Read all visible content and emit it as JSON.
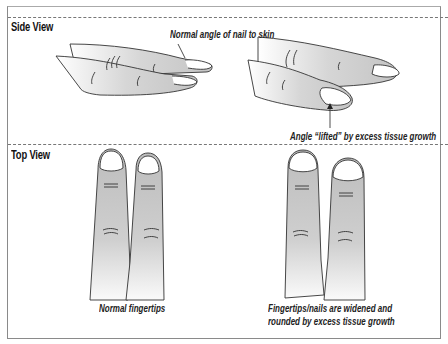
{
  "diagram": {
    "sections": [
      {
        "title": "Side View",
        "panels": [
          {
            "id": "side-normal",
            "caption": "Normal angle of nail to skin"
          },
          {
            "id": "side-clubbed",
            "caption": "Angle “lifted” by excess tissue growth"
          }
        ]
      },
      {
        "title": "Top View",
        "panels": [
          {
            "id": "top-normal",
            "caption_lines": [
              "Normal fingertips"
            ]
          },
          {
            "id": "top-clubbed",
            "caption_lines": [
              "Fingertips/nails are widened and",
              "rounded by excess tissue growth"
            ]
          }
        ]
      }
    ],
    "colors": {
      "skin_shade": "#c8c8c8",
      "outline": "#333333",
      "border": "#8a8a8a"
    }
  }
}
